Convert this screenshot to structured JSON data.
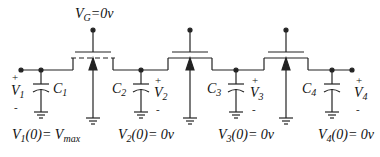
{
  "diagram": {
    "type": "circuit-schematic",
    "gate_label": {
      "main": "V",
      "sub": "G",
      "rest": "=0v"
    },
    "nodes": [
      {
        "id": 1,
        "voltage": {
          "main": "V",
          "sub": "1"
        },
        "capacitor": {
          "main": "C",
          "sub": "1"
        },
        "initial": {
          "main": "V",
          "sub": "1",
          "rest": "(0)= ",
          "val_main": "V",
          "val_sub": "max"
        }
      },
      {
        "id": 2,
        "voltage": {
          "main": "V",
          "sub": "2"
        },
        "capacitor": {
          "main": "C",
          "sub": "2"
        },
        "initial": {
          "main": "V",
          "sub": "2",
          "rest": "(0)= 0v"
        }
      },
      {
        "id": 3,
        "voltage": {
          "main": "V",
          "sub": "3"
        },
        "capacitor": {
          "main": "C",
          "sub": "3"
        },
        "initial": {
          "main": "V",
          "sub": "3",
          "rest": "(0)= 0v"
        }
      },
      {
        "id": 4,
        "voltage": {
          "main": "V",
          "sub": "4"
        },
        "capacitor": {
          "main": "C",
          "sub": "4"
        },
        "initial": {
          "main": "V",
          "sub": "4",
          "rest": "(0)= 0v"
        }
      }
    ],
    "plus_sign": "+",
    "minus_sign": "-",
    "transistor_count": 3,
    "colors": {
      "line": "#222222",
      "wire_gray": "#777777"
    }
  }
}
